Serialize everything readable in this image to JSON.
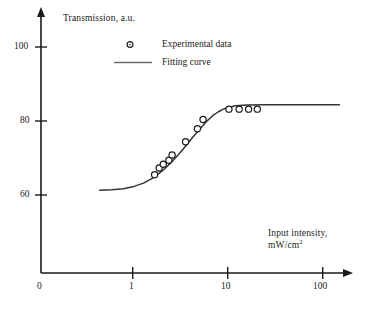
{
  "chart_data": {
    "type": "scatter",
    "title": "",
    "xlabel": "Input intensity, mW/cm2",
    "xlabel_line1": "Input intensity,",
    "xlabel_line2_prefix": "mW/cm",
    "xlabel_line2_sup": "2",
    "ylabel": "Transmission, a.u.",
    "xscale": "log",
    "yscale": "linear",
    "xlim": [
      0.35,
      170
    ],
    "ylim": [
      52,
      103
    ],
    "grid": false,
    "legend_position": "upper-center",
    "x_tick_labels": [
      "0",
      "1",
      "10",
      "100"
    ],
    "x_tick_values": [
      0,
      1,
      10,
      100
    ],
    "y_tick_labels": [
      "60",
      "80",
      "100"
    ],
    "y_tick_values": [
      60,
      80,
      100
    ],
    "series": [
      {
        "name": "Experimental data",
        "marker": "open-circle",
        "x": [
          1.7,
          1.9,
          2.1,
          2.4,
          2.6,
          3.6,
          4.8,
          5.5,
          10.3,
          13.2,
          16.6,
          20.5
        ],
        "y": [
          65.5,
          67.3,
          68.3,
          69.4,
          70.8,
          74.4,
          77.9,
          80.4,
          83.2,
          83.2,
          83.2,
          83.2
        ]
      },
      {
        "name": "Fitting curve",
        "marker": "line",
        "description": "sigmoid saturation curve from 61.3 a.u. baseline to 84.4 a.u. plateau",
        "baseline": 61.3,
        "plateau": 84.4,
        "x": [
          0.45,
          0.6,
          0.8,
          1.0,
          1.3,
          1.6,
          2.0,
          2.5,
          3.0,
          3.6,
          4.3,
          5.0,
          6.0,
          7.0,
          8.0,
          9.0,
          10.0,
          12.0,
          16.0,
          25.0,
          50.0,
          100.0,
          150.0
        ],
        "y": [
          61.3,
          61.4,
          61.7,
          62.2,
          63.2,
          64.5,
          66.3,
          68.6,
          70.8,
          73.2,
          75.7,
          77.6,
          79.9,
          81.5,
          82.5,
          83.2,
          83.6,
          84.1,
          84.3,
          84.4,
          84.4,
          84.4,
          84.4
        ]
      }
    ],
    "legend": [
      {
        "label": "Experimental data",
        "marker": "open-circle"
      },
      {
        "label": "Fitting curve",
        "marker": "line"
      }
    ]
  },
  "axes": {
    "y_title": "Transmission, a.u.",
    "x_title_line1": "Input intensity,",
    "x_title_line2": "mW/cm",
    "x_title_line2_sup": "2",
    "y_ticks": [
      {
        "label": "100",
        "value": 100
      },
      {
        "label": "80",
        "value": 80
      },
      {
        "label": "60",
        "value": 60
      }
    ],
    "x_ticks": [
      {
        "label": "0",
        "value": 0
      },
      {
        "label": "1",
        "value": 1
      },
      {
        "label": "10",
        "value": 10
      },
      {
        "label": "100",
        "value": 100
      }
    ]
  },
  "colors": {
    "axis": "#1a1a1a",
    "curve": "#333333",
    "marker_stroke": "#1a1a1a",
    "marker_fill": "#ffffff",
    "background": "#ffffff",
    "text": "#1a1a1a"
  }
}
